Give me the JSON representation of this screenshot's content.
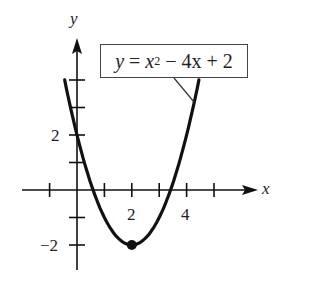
{
  "chart_data": {
    "type": "line",
    "title": "",
    "equation": "y = x^2 - 4x + 2",
    "equation_parts": {
      "lhs": "y",
      "eq": " = ",
      "x": "x",
      "exp": "2",
      "rest": " − 4x + 2"
    },
    "xlabel": "x",
    "ylabel": "y",
    "xlim": [
      -1.4,
      6.9
    ],
    "ylim": [
      -3.0,
      5.0
    ],
    "x_ticks": [
      -1,
      0,
      1,
      2,
      3,
      4,
      5
    ],
    "y_ticks": [
      -2,
      -1,
      0,
      1,
      2,
      3,
      4
    ],
    "x_tick_labels": [
      {
        "value": 2,
        "label": "2"
      },
      {
        "value": 4,
        "label": "4"
      }
    ],
    "y_tick_labels": [
      {
        "value": 2,
        "label": "2"
      },
      {
        "value": -2,
        "label": "−2"
      }
    ],
    "grid": false,
    "legend": "none",
    "series": [
      {
        "name": "y = x^2 - 4x + 2",
        "function": "x^2 - 4x + 2",
        "x": [
          -0.45,
          0,
          0.5,
          1,
          1.5,
          2,
          2.5,
          3,
          3.5,
          4,
          4.45
        ],
        "y": [
          4.0,
          2.0,
          0.25,
          -1.0,
          -1.75,
          -2.0,
          -1.75,
          -1.0,
          0.25,
          2.0,
          4.0
        ]
      }
    ],
    "annotations": [
      {
        "type": "point",
        "label": "vertex",
        "x": 2,
        "y": -2
      },
      {
        "type": "callout-box",
        "text": "y = x^2 - 4x + 2",
        "points_to": "curve right branch"
      }
    ],
    "colors": {
      "curve": "#111111",
      "axes": "#111111",
      "text": "#222222"
    }
  },
  "labels": {
    "x_axis": "x",
    "y_axis": "y",
    "tick_x_2": "2",
    "tick_x_4": "4",
    "tick_y_2": "2",
    "tick_y_neg2": "−2"
  }
}
